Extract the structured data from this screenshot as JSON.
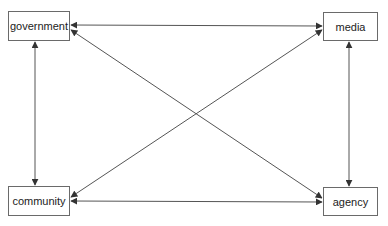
{
  "diagram": {
    "type": "relationship-network",
    "colors": {
      "line": "#555555",
      "box_border": "#6a6a6a",
      "text": "#222222",
      "background": "#ffffff"
    },
    "nodes": [
      {
        "id": "government",
        "label": "government",
        "x": 8,
        "y": 11,
        "w": 62,
        "h": 30
      },
      {
        "id": "media",
        "label": "media",
        "x": 323,
        "y": 12,
        "w": 55,
        "h": 29
      },
      {
        "id": "community",
        "label": "community",
        "x": 8,
        "y": 186,
        "w": 62,
        "h": 30
      },
      {
        "id": "agency",
        "label": "agency",
        "x": 323,
        "y": 187,
        "w": 55,
        "h": 29
      }
    ],
    "edges": [
      {
        "from": "government",
        "to": "media",
        "direction": "both"
      },
      {
        "from": "government",
        "to": "community",
        "direction": "both"
      },
      {
        "from": "government",
        "to": "agency",
        "direction": "both"
      },
      {
        "from": "media",
        "to": "community",
        "direction": "both"
      },
      {
        "from": "media",
        "to": "agency",
        "direction": "both"
      },
      {
        "from": "community",
        "to": "agency",
        "direction": "both"
      }
    ]
  }
}
